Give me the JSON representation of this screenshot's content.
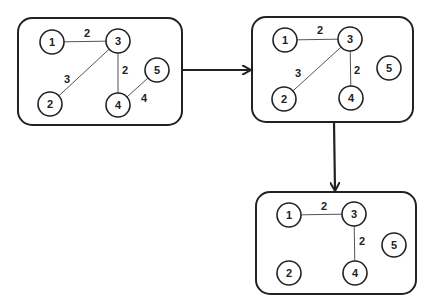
{
  "diagram": {
    "type": "graph-transformation",
    "panels": [
      {
        "id": "panel-1",
        "nodes": [
          {
            "id": "1",
            "label": "1",
            "x": 52,
            "y": 42
          },
          {
            "id": "2",
            "label": "2",
            "x": 50,
            "y": 104
          },
          {
            "id": "3",
            "label": "3",
            "x": 118,
            "y": 41
          },
          {
            "id": "4",
            "label": "4",
            "x": 118,
            "y": 105
          },
          {
            "id": "5",
            "label": "5",
            "x": 157,
            "y": 70
          }
        ],
        "edges": [
          {
            "from": "1",
            "to": "3",
            "weight": "2",
            "lx": 87,
            "ly": 33
          },
          {
            "from": "3",
            "to": "2",
            "weight": "3",
            "lx": 67,
            "ly": 79
          },
          {
            "from": "3",
            "to": "4",
            "weight": "2",
            "lx": 125,
            "ly": 70
          },
          {
            "from": "4",
            "to": "5",
            "weight": "4",
            "lx": 144,
            "ly": 98
          }
        ]
      },
      {
        "id": "panel-2",
        "nodes": [
          {
            "id": "1",
            "label": "1",
            "x": 285,
            "y": 40
          },
          {
            "id": "2",
            "label": "2",
            "x": 284,
            "y": 99
          },
          {
            "id": "3",
            "label": "3",
            "x": 350,
            "y": 39
          },
          {
            "id": "4",
            "label": "4",
            "x": 351,
            "y": 98
          },
          {
            "id": "5",
            "label": "5",
            "x": 389,
            "y": 68
          }
        ],
        "edges": [
          {
            "from": "1",
            "to": "3",
            "weight": "2",
            "lx": 320,
            "ly": 30
          },
          {
            "from": "3",
            "to": "2",
            "weight": "3",
            "lx": 298,
            "ly": 73
          },
          {
            "from": "3",
            "to": "4",
            "weight": "2",
            "lx": 357,
            "ly": 70
          }
        ]
      },
      {
        "id": "panel-3",
        "nodes": [
          {
            "id": "1",
            "label": "1",
            "x": 289,
            "y": 215
          },
          {
            "id": "2",
            "label": "2",
            "x": 289,
            "y": 273
          },
          {
            "id": "3",
            "label": "3",
            "x": 354,
            "y": 214
          },
          {
            "id": "4",
            "label": "4",
            "x": 355,
            "y": 273
          },
          {
            "id": "5",
            "label": "5",
            "x": 394,
            "y": 245
          }
        ],
        "edges": [
          {
            "from": "1",
            "to": "3",
            "weight": "2",
            "lx": 324,
            "ly": 206
          },
          {
            "from": "3",
            "to": "4",
            "weight": "2",
            "lx": 362,
            "ly": 241
          }
        ]
      }
    ],
    "arrows": [
      {
        "from": "panel-1",
        "to": "panel-2",
        "direction": "right"
      },
      {
        "from": "panel-2",
        "to": "panel-3",
        "direction": "down"
      }
    ]
  }
}
